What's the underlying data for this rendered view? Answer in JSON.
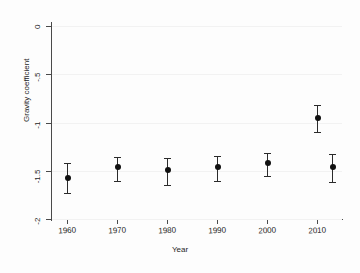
{
  "chart_data": {
    "type": "scatter",
    "title": "",
    "xlabel": "Year",
    "ylabel": "Gravity coefficient",
    "xlim": [
      1957,
      2015
    ],
    "ylim": [
      -2,
      0
    ],
    "grid": false,
    "legend": null,
    "x_tick_labels": [
      "1960",
      "1970",
      "1980",
      "1990",
      "2000",
      "2010"
    ],
    "x_ticks": [
      1960,
      1970,
      1980,
      1990,
      2000,
      2010
    ],
    "y_tick_labels": [
      "0",
      "-.5",
      "-1",
      "-1.5",
      "-2"
    ],
    "y_ticks": [
      0,
      -0.5,
      -1,
      -1.5,
      -2
    ],
    "series": [
      {
        "name": "Gravity coefficient",
        "marker": "filled-circle",
        "error_style": "capped-whisker",
        "points": [
          {
            "x": 1960,
            "y": -1.58,
            "lo": -1.73,
            "hi": -1.42
          },
          {
            "x": 1970,
            "y": -1.46,
            "lo": -1.61,
            "hi": -1.36
          },
          {
            "x": 1980,
            "y": -1.49,
            "lo": -1.65,
            "hi": -1.37
          },
          {
            "x": 1990,
            "y": -1.46,
            "lo": -1.61,
            "hi": -1.35
          },
          {
            "x": 2000,
            "y": -1.42,
            "lo": -1.55,
            "hi": -1.32
          },
          {
            "x": 2010,
            "y": -0.95,
            "lo": -1.1,
            "hi": -0.82
          },
          {
            "x": 2013,
            "y": -1.46,
            "lo": -1.62,
            "hi": -1.33
          }
        ]
      }
    ],
    "colors": {
      "marker": "#111111",
      "whisker": "#2b2b2b",
      "axis": "#4a4a4a",
      "background": "#fdfdfd",
      "text": "#1d1d1d"
    }
  }
}
